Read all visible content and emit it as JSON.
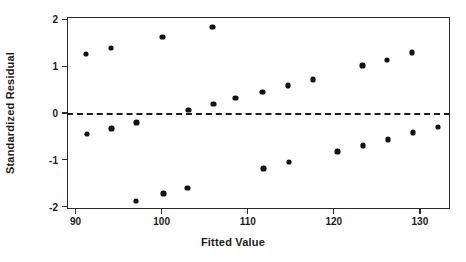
{
  "chart_data": {
    "type": "scatter",
    "title": "",
    "xlabel": "Fitted Value",
    "ylabel": "Standardized Residual",
    "xlim": [
      89.0,
      133.5
    ],
    "ylim": [
      -2.05,
      2.05
    ],
    "xticks": [
      90,
      100,
      110,
      120,
      130
    ],
    "yticks": [
      -2,
      -1,
      0,
      1,
      2
    ],
    "xtick_labels": [
      "90",
      "100",
      "110",
      "120",
      "130"
    ],
    "ytick_labels": [
      "-2",
      "-1",
      "0",
      "1",
      "2"
    ],
    "grid": false,
    "legend": null,
    "marker": "diamond",
    "marker_color": "#141414",
    "frame_color": "#2b2b2b",
    "background": "#ffffff",
    "reference_line": {
      "name": "zero-residual-line",
      "orientation": "horizontal",
      "y": 0,
      "style": "dashed",
      "color": "#1c1c1c"
    },
    "points": [
      {
        "x": 91.2,
        "y": 1.26
      },
      {
        "x": 91.3,
        "y": -0.45
      },
      {
        "x": 94.1,
        "y": 1.39
      },
      {
        "x": 94.2,
        "y": -0.33
      },
      {
        "x": 97.0,
        "y": -1.88
      },
      {
        "x": 97.1,
        "y": -0.2
      },
      {
        "x": 100.1,
        "y": 1.62
      },
      {
        "x": 100.2,
        "y": -1.72
      },
      {
        "x": 103.0,
        "y": -1.6
      },
      {
        "x": 103.1,
        "y": 0.06
      },
      {
        "x": 105.9,
        "y": 1.84
      },
      {
        "x": 106.0,
        "y": 0.19
      },
      {
        "x": 108.6,
        "y": 0.32
      },
      {
        "x": 111.7,
        "y": 0.45
      },
      {
        "x": 111.8,
        "y": -1.18
      },
      {
        "x": 114.7,
        "y": 0.59
      },
      {
        "x": 114.8,
        "y": -1.05
      },
      {
        "x": 117.6,
        "y": 0.72
      },
      {
        "x": 120.4,
        "y": -0.82
      },
      {
        "x": 123.3,
        "y": 1.01
      },
      {
        "x": 123.4,
        "y": -0.7
      },
      {
        "x": 126.2,
        "y": 1.13
      },
      {
        "x": 126.3,
        "y": -0.56
      },
      {
        "x": 129.1,
        "y": 1.29
      },
      {
        "x": 129.2,
        "y": -0.42
      },
      {
        "x": 132.1,
        "y": -0.3
      }
    ]
  }
}
